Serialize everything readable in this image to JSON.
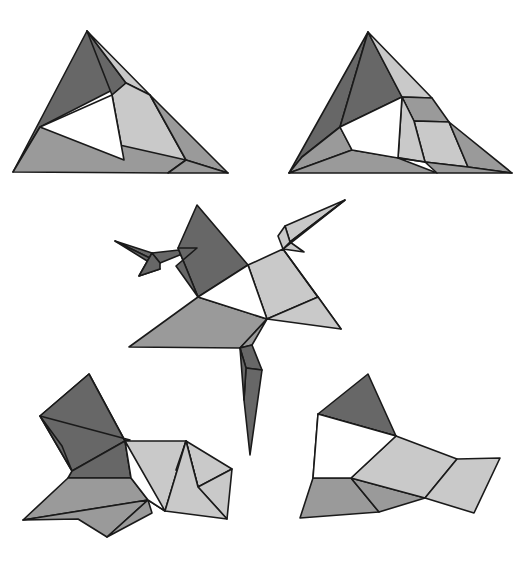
{
  "page": {
    "background_color": "#ffffff",
    "width": 526,
    "height": 564
  },
  "palette": {
    "dark_gray": "#676767",
    "medium_gray": "#9a9a9a",
    "light_gray": "#c9c9c9",
    "white": "#ffffff",
    "outline": "#1a1a1a"
  },
  "figures": [
    {
      "id": "figure-top-left",
      "label": "Flat triangular net, stage 1",
      "faces": [
        {
          "name": "dark-left-wing",
          "fill": "#676767",
          "points": "87,31 13,172 40,127 126,83"
        },
        {
          "name": "dark-apex-fold",
          "fill": "#676767",
          "points": "87,31 126,83 112,95"
        },
        {
          "name": "light-top-sliver",
          "fill": "#c9c9c9",
          "points": "87,31 150,95 126,83"
        },
        {
          "name": "light-right-band",
          "fill": "#c9c9c9",
          "points": "150,95 186,160 124,160 112,95 126,83"
        },
        {
          "name": "medium-right-end",
          "fill": "#9a9a9a",
          "points": "150,95 228,173 186,160"
        },
        {
          "name": "medium-bottom",
          "fill": "#9a9a9a",
          "points": "13,172 40,127 186,160 168,173"
        },
        {
          "name": "medium-bottom-r",
          "fill": "#9a9a9a",
          "points": "168,173 186,160 228,173"
        },
        {
          "name": "inner-white",
          "fill": "#ffffff",
          "points": "112,95 124,160 40,127"
        }
      ]
    },
    {
      "id": "figure-top-right",
      "label": "Flat triangular net with extra creases, stage 2",
      "faces": [
        {
          "name": "dark-left-wing",
          "fill": "#676767",
          "points": "368,32 340,127 302,157 289,173 368,32"
        },
        {
          "name": "dark-upper-left",
          "fill": "#676767",
          "points": "368,32 340,127 402,97"
        },
        {
          "name": "medium-left-low",
          "fill": "#9a9a9a",
          "points": "340,127 302,157 289,173 352,150"
        },
        {
          "name": "light-top-sliver",
          "fill": "#c9c9c9",
          "points": "368,32 432,98 402,97"
        },
        {
          "name": "medium-right-wedge",
          "fill": "#9a9a9a",
          "points": "402,97 432,98 449,122 414,121"
        },
        {
          "name": "light-right-band",
          "fill": "#c9c9c9",
          "points": "414,121 449,122 468,167 425,162"
        },
        {
          "name": "light-mid-band",
          "fill": "#c9c9c9",
          "points": "402,97 414,121 425,162 398,158"
        },
        {
          "name": "medium-right-end",
          "fill": "#9a9a9a",
          "points": "449,122 512,173 468,167"
        },
        {
          "name": "medium-bottom",
          "fill": "#9a9a9a",
          "points": "289,173 352,150 425,162 398,158 437,173"
        },
        {
          "name": "medium-bottom-r",
          "fill": "#9a9a9a",
          "points": "437,173 425,162 468,167 512,173"
        },
        {
          "name": "inner-white",
          "fill": "#ffffff",
          "points": "402,97 398,158 352,150 340,127"
        }
      ]
    },
    {
      "id": "figure-middle",
      "label": "Partially folded star configuration, stage 3",
      "faces": [
        {
          "name": "dark-left-spike-upper",
          "fill": "#676767",
          "points": "115,241 160,263 197,248 152,253"
        },
        {
          "name": "dark-left-spike-lower",
          "fill": "#676767",
          "points": "115,241 160,263 152,253 139,276 160,269"
        },
        {
          "name": "dark-left-spike-tip",
          "fill": "#676767",
          "points": "152,253 160,263 160,269 139,276"
        },
        {
          "name": "dark-center-large",
          "fill": "#676767",
          "points": "197,205 248,265 198,297 178,248"
        },
        {
          "name": "dark-center-left",
          "fill": "#676767",
          "points": "197,248 178,248 198,297 176,266"
        },
        {
          "name": "light-right-spike-top",
          "fill": "#c9c9c9",
          "points": "345,200 290,242 285,226"
        },
        {
          "name": "light-right-spike-low",
          "fill": "#c9c9c9",
          "points": "345,200 290,242 304,252 283,249"
        },
        {
          "name": "light-right-wedge",
          "fill": "#c9c9c9",
          "points": "285,226 290,242 283,249 278,236"
        },
        {
          "name": "light-center-right",
          "fill": "#c9c9c9",
          "points": "248,265 283,249 318,297 267,319"
        },
        {
          "name": "light-right-fan",
          "fill": "#c9c9c9",
          "points": "283,249 341,329 318,297"
        },
        {
          "name": "light-right-long",
          "fill": "#c9c9c9",
          "points": "318,297 341,329 267,319"
        },
        {
          "name": "medium-bottom-left",
          "fill": "#9a9a9a",
          "points": "198,297 267,319 240,348 129,347"
        },
        {
          "name": "medium-bottom-right",
          "fill": "#9a9a9a",
          "points": "240,348 267,319 252,345"
        },
        {
          "name": "dark-down-spike-upper",
          "fill": "#676767",
          "points": "240,348 252,345 262,370 246,368"
        },
        {
          "name": "dark-down-spike-lower",
          "fill": "#676767",
          "points": "246,368 262,370 250,455 244,400"
        },
        {
          "name": "dark-down-spike-tip",
          "fill": "#676767",
          "points": "240,348 246,368 244,400"
        },
        {
          "name": "inner-white",
          "fill": "#ffffff",
          "points": "248,265 198,297 267,319"
        }
      ]
    },
    {
      "id": "figure-bottom-left",
      "label": "Nearly folded configuration, stage 4",
      "faces": [
        {
          "name": "dark-top-panel",
          "fill": "#676767",
          "points": "89,374 40,416 72,471 125,441"
        },
        {
          "name": "dark-top-fold",
          "fill": "#676767",
          "points": "89,374 125,441 130,440 40,416"
        },
        {
          "name": "dark-top-sliver",
          "fill": "#676767",
          "points": "40,416 72,471 62,446"
        },
        {
          "name": "dark-left-lower",
          "fill": "#676767",
          "points": "72,471 125,441 131,478 68,478"
        },
        {
          "name": "medium-bottom-left",
          "fill": "#9a9a9a",
          "points": "68,478 131,478 148,500 23,520"
        },
        {
          "name": "medium-bottom-fold",
          "fill": "#9a9a9a",
          "points": "23,520 148,500 107,537 78,519"
        },
        {
          "name": "medium-bottom-tip",
          "fill": "#9a9a9a",
          "points": "107,537 148,500 152,513"
        },
        {
          "name": "light-right-panel",
          "fill": "#c9c9c9",
          "points": "125,441 186,441 165,511 148,500"
        },
        {
          "name": "light-right-upper",
          "fill": "#c9c9c9",
          "points": "186,441 232,469 198,487"
        },
        {
          "name": "light-right-wedge",
          "fill": "#c9c9c9",
          "points": "186,441 198,487 176,470"
        },
        {
          "name": "light-right-fan",
          "fill": "#c9c9c9",
          "points": "198,487 232,469 227,519"
        },
        {
          "name": "light-right-long",
          "fill": "#c9c9c9",
          "points": "186,441 198,487 227,519 165,511"
        },
        {
          "name": "inner-white",
          "fill": "#ffffff",
          "points": "125,441 165,511 148,500 131,478"
        }
      ]
    },
    {
      "id": "figure-bottom-right",
      "label": "Fully folded configuration, stage 5",
      "faces": [
        {
          "name": "dark-top-panel",
          "fill": "#676767",
          "points": "368,374 318,414 396,436"
        },
        {
          "name": "dark-left-panel",
          "fill": "#676767",
          "points": "318,414 396,436 351,478 313,478"
        },
        {
          "name": "medium-bottom-left",
          "fill": "#9a9a9a",
          "points": "313,478 351,478 379,512 300,518"
        },
        {
          "name": "medium-bottom-mid",
          "fill": "#9a9a9a",
          "points": "351,478 425,498 379,512"
        },
        {
          "name": "light-right-panel",
          "fill": "#c9c9c9",
          "points": "396,436 457,459 425,498 351,478"
        },
        {
          "name": "light-right-wing",
          "fill": "#c9c9c9",
          "points": "457,459 500,458 474,513 425,498"
        },
        {
          "name": "inner-white",
          "fill": "#ffffff",
          "points": "396,436 351,478 313,478 318,414"
        }
      ]
    }
  ]
}
